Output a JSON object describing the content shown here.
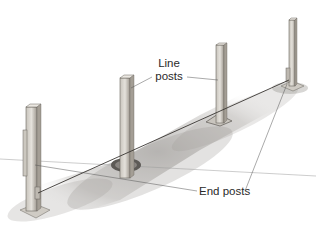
{
  "figure": {
    "labels": {
      "line_posts_line1": "Line",
      "line_posts_line2": "posts",
      "end_posts": "End posts"
    },
    "posts": [
      {
        "id": "end-post-front",
        "role": "End post"
      },
      {
        "id": "line-post-1",
        "role": "Line post"
      },
      {
        "id": "line-post-2",
        "role": "Line post"
      },
      {
        "id": "end-post-back",
        "role": "End post"
      }
    ],
    "colors": {
      "ink": "#2a2a2a",
      "post_fill": "#d9d6d0",
      "post_shade": "#a9a49c",
      "ground_shadow": "#9c9a96",
      "background": "#ffffff"
    }
  }
}
